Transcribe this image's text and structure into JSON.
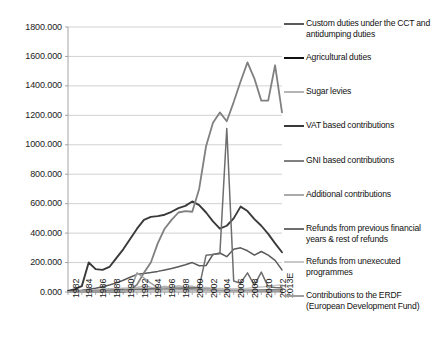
{
  "chart_data": {
    "type": "line",
    "title": "",
    "xlabel": "",
    "ylabel": "",
    "ylim": [
      0,
      1800
    ],
    "ytick_step": 200,
    "grid": true,
    "legend_position": "right",
    "x": [
      1982,
      1983,
      1984,
      1985,
      1986,
      1987,
      1988,
      1989,
      1990,
      1991,
      1992,
      1993,
      1994,
      1995,
      1996,
      1997,
      1998,
      1999,
      2000,
      2001,
      2002,
      2003,
      2004,
      2005,
      2006,
      2007,
      2008,
      2009,
      2010,
      2011,
      2012,
      2013
    ],
    "tick_labels": [
      "1982",
      "1984",
      "1986",
      "1988",
      "1990",
      "1992",
      "1994",
      "1996",
      "1998",
      "2000",
      "2002",
      "2004",
      "2006",
      "2008",
      "2010",
      "2012",
      "2013E"
    ],
    "ytick_labels": [
      "0.000",
      "200.000",
      "400.000",
      "600.000",
      "800.000",
      "1000.000",
      "1200.000",
      "1400.000",
      "1600.000",
      "1800.000"
    ],
    "series": [
      {
        "name": "Custom duties under the CCT and antidumping duties",
        "color": "#5a5a5a",
        "width": 1.5,
        "values": [
          4,
          8,
          12,
          18,
          26,
          36,
          48,
          62,
          80,
          100,
          120,
          126,
          132,
          140,
          150,
          160,
          172,
          185,
          200,
          178,
          180,
          255,
          265,
          240,
          290,
          300,
          280,
          250,
          275,
          250,
          215,
          150
        ]
      },
      {
        "name": "Agricultural duties",
        "color": "#111111",
        "width": 1.9,
        "values": [
          2,
          3,
          4,
          5,
          7,
          9,
          11,
          12,
          14,
          16,
          18,
          19,
          20,
          21,
          22,
          22,
          23,
          23,
          24,
          22,
          20,
          19,
          18,
          17,
          16,
          15,
          14,
          13,
          12,
          12,
          11,
          10
        ]
      },
      {
        "name": "Sugar levies",
        "color": "#b5b5b5",
        "width": 1.5,
        "values": [
          3,
          5,
          8,
          12,
          16,
          20,
          22,
          24,
          26,
          28,
          30,
          40,
          32,
          28,
          40,
          30,
          42,
          32,
          40,
          28,
          30,
          26,
          24,
          22,
          20,
          18,
          16,
          14,
          12,
          10,
          9,
          8
        ]
      },
      {
        "name": "VAT based contributions",
        "color": "#3a3a3a",
        "width": 1.9,
        "values": [
          8,
          20,
          40,
          200,
          155,
          150,
          170,
          230,
          290,
          360,
          430,
          490,
          510,
          515,
          525,
          545,
          570,
          585,
          615,
          590,
          540,
          480,
          430,
          450,
          500,
          580,
          550,
          495,
          450,
          395,
          330,
          270
        ]
      },
      {
        "name": "GNI based contributions",
        "color": "#808080",
        "width": 1.8,
        "values": [
          0,
          0,
          0,
          0,
          0,
          0,
          0,
          0,
          0,
          10,
          50,
          130,
          200,
          330,
          430,
          490,
          540,
          550,
          545,
          700,
          990,
          1150,
          1220,
          1160,
          1290,
          1430,
          1560,
          1450,
          1300,
          1300,
          1540,
          1220
        ]
      },
      {
        "name": "Additional contributions",
        "color": "#aaaaaa",
        "width": 1.5,
        "values": [
          2,
          3,
          4,
          5,
          6,
          8,
          10,
          12,
          14,
          18,
          22,
          26,
          20,
          18,
          22,
          20,
          24,
          22,
          25,
          22,
          20,
          18,
          16,
          14,
          14,
          13,
          12,
          11,
          10,
          10,
          9,
          8
        ]
      },
      {
        "name": "Refunds from previous financial years & rest of refunds",
        "color": "#6e6e6e",
        "width": 1.5,
        "values": [
          1,
          2,
          3,
          4,
          5,
          6,
          8,
          10,
          12,
          14,
          16,
          18,
          20,
          22,
          24,
          24,
          26,
          26,
          28,
          30,
          250,
          255,
          260,
          1110,
          75,
          60,
          130,
          45,
          135,
          35,
          30,
          28
        ]
      },
      {
        "name": "Refunds from unexecuted programmes",
        "color": "#c8c8c8",
        "width": 1.5,
        "values": [
          1,
          1,
          2,
          2,
          3,
          3,
          4,
          5,
          6,
          7,
          8,
          9,
          10,
          11,
          12,
          12,
          13,
          13,
          14,
          14,
          15,
          16,
          18,
          20,
          22,
          24,
          26,
          30,
          34,
          38,
          44,
          50
        ]
      },
      {
        "name": "Contributions to the ERDF (European Development Fund)",
        "color": "#9e9e9e",
        "width": 1.5,
        "values": [
          1,
          1,
          2,
          2,
          3,
          4,
          5,
          6,
          8,
          10,
          130,
          95,
          60,
          30,
          22,
          20,
          18,
          16,
          15,
          14,
          13,
          12,
          11,
          10,
          9,
          9,
          8,
          8,
          7,
          7,
          7,
          6
        ]
      }
    ]
  },
  "legend": {
    "items": [
      {
        "label": "Custom duties under the CCT and antidumping duties",
        "color": "#5a5a5a",
        "top": 18
      },
      {
        "label": "Agricultural duties",
        "color": "#111111",
        "top": 52
      },
      {
        "label": "Sugar levies",
        "color": "#b5b5b5",
        "top": 86
      },
      {
        "label": "VAT based contributions",
        "color": "#3a3a3a",
        "top": 120
      },
      {
        "label": "GNI based contributions",
        "color": "#808080",
        "top": 155
      },
      {
        "label": "Additional contributions",
        "color": "#aaaaaa",
        "top": 189
      },
      {
        "label": "Refunds from previous financial years & rest of refunds",
        "color": "#6e6e6e",
        "top": 223
      },
      {
        "label": "Refunds from unexecuted programmes",
        "color": "#c8c8c8",
        "top": 256
      },
      {
        "label": "Contributions to the ERDF (European Development Fund)",
        "color": "#9e9e9e",
        "top": 290
      }
    ]
  },
  "axes": {
    "plot_left": 68,
    "plot_right": 282,
    "plot_top": 27,
    "plot_bottom": 292
  }
}
